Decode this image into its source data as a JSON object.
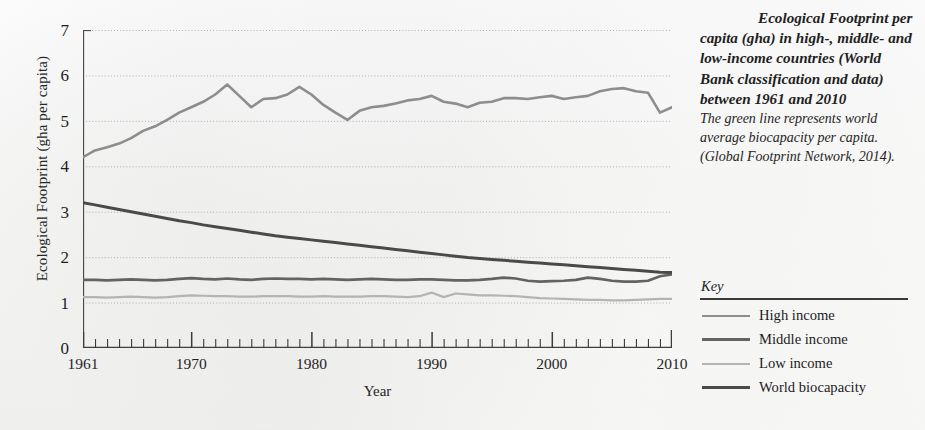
{
  "caption": {
    "title": "Ecological Footprint per capita (gha) in high-, middle- and low-income countries (World Bank classification and data) between 1961 and 2010",
    "subtitle": "The green line represents world average biocapacity per capita. (Global Footprint Network, 2014)."
  },
  "legend": {
    "title": "Key",
    "items": [
      {
        "label": "High income",
        "color": "#8d8d8d",
        "width": 2.6
      },
      {
        "label": "Middle income",
        "color": "#636363",
        "width": 3.0
      },
      {
        "label": "Low income",
        "color": "#b4b4b4",
        "width": 2.4
      },
      {
        "label": "World biocapacity",
        "color": "#4a4a4a",
        "width": 3.2
      }
    ]
  },
  "chart_data": {
    "type": "line",
    "title": "",
    "xlabel": "Year",
    "ylabel": "Ecological Footprint (gha per capita)",
    "xlim": [
      1961,
      2010
    ],
    "ylim": [
      0,
      7
    ],
    "ytick_values": [
      0,
      1,
      2,
      3,
      4,
      5,
      6,
      7
    ],
    "ytick_labels": [
      "0",
      "1",
      "2",
      "3",
      "4",
      "5",
      "6",
      "7"
    ],
    "xtick_labels": [
      "1961",
      "1970",
      "1980",
      "1990",
      "2000",
      "2010"
    ],
    "xtick_values": [
      1961,
      1970,
      1980,
      1990,
      2000,
      2010
    ],
    "minor_xticks_every": 1,
    "grid": "horizontal-dotted",
    "legend_position": "right-outside",
    "x": [
      1961,
      1962,
      1963,
      1964,
      1965,
      1966,
      1967,
      1968,
      1969,
      1970,
      1971,
      1972,
      1973,
      1974,
      1975,
      1976,
      1977,
      1978,
      1979,
      1980,
      1981,
      1982,
      1983,
      1984,
      1985,
      1986,
      1987,
      1988,
      1989,
      1990,
      1991,
      1992,
      1993,
      1994,
      1995,
      1996,
      1997,
      1998,
      1999,
      2000,
      2001,
      2002,
      2003,
      2004,
      2005,
      2006,
      2007,
      2008,
      2009,
      2010
    ],
    "series": [
      {
        "name": "High income",
        "color": "#8d8d8d",
        "values": [
          4.2,
          4.35,
          4.42,
          4.5,
          4.62,
          4.78,
          4.88,
          5.02,
          5.18,
          5.3,
          5.42,
          5.58,
          5.8,
          5.55,
          5.3,
          5.48,
          5.5,
          5.58,
          5.75,
          5.58,
          5.35,
          5.18,
          5.02,
          5.22,
          5.3,
          5.33,
          5.38,
          5.45,
          5.48,
          5.55,
          5.42,
          5.38,
          5.3,
          5.4,
          5.42,
          5.5,
          5.5,
          5.48,
          5.52,
          5.55,
          5.48,
          5.52,
          5.55,
          5.65,
          5.7,
          5.72,
          5.65,
          5.62,
          5.18,
          5.3
        ]
      },
      {
        "name": "Middle income",
        "color": "#636363",
        "values": [
          1.5,
          1.5,
          1.49,
          1.5,
          1.51,
          1.5,
          1.49,
          1.5,
          1.52,
          1.54,
          1.52,
          1.51,
          1.53,
          1.51,
          1.5,
          1.52,
          1.53,
          1.52,
          1.52,
          1.51,
          1.52,
          1.51,
          1.5,
          1.51,
          1.52,
          1.51,
          1.5,
          1.5,
          1.51,
          1.51,
          1.5,
          1.49,
          1.49,
          1.5,
          1.52,
          1.55,
          1.53,
          1.48,
          1.46,
          1.47,
          1.48,
          1.5,
          1.55,
          1.52,
          1.48,
          1.46,
          1.46,
          1.48,
          1.58,
          1.62
        ]
      },
      {
        "name": "Low income",
        "color": "#b4b4b4",
        "values": [
          1.12,
          1.12,
          1.11,
          1.12,
          1.13,
          1.12,
          1.11,
          1.12,
          1.14,
          1.16,
          1.15,
          1.14,
          1.14,
          1.13,
          1.13,
          1.14,
          1.14,
          1.14,
          1.13,
          1.13,
          1.14,
          1.13,
          1.13,
          1.13,
          1.14,
          1.14,
          1.13,
          1.12,
          1.14,
          1.22,
          1.12,
          1.2,
          1.18,
          1.16,
          1.16,
          1.15,
          1.14,
          1.12,
          1.1,
          1.09,
          1.08,
          1.07,
          1.06,
          1.06,
          1.05,
          1.05,
          1.06,
          1.07,
          1.08,
          1.08
        ]
      },
      {
        "name": "World biocapacity",
        "color": "#4a4a4a",
        "values": [
          3.2,
          3.15,
          3.1,
          3.05,
          3.0,
          2.95,
          2.9,
          2.85,
          2.8,
          2.76,
          2.71,
          2.67,
          2.63,
          2.59,
          2.55,
          2.51,
          2.47,
          2.44,
          2.41,
          2.38,
          2.35,
          2.32,
          2.29,
          2.26,
          2.23,
          2.2,
          2.17,
          2.14,
          2.11,
          2.08,
          2.05,
          2.02,
          1.99,
          1.97,
          1.95,
          1.93,
          1.91,
          1.89,
          1.87,
          1.85,
          1.83,
          1.81,
          1.79,
          1.77,
          1.75,
          1.73,
          1.71,
          1.69,
          1.67,
          1.66
        ]
      }
    ]
  }
}
